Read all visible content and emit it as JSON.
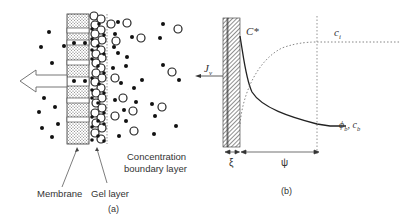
{
  "panel_a": {
    "caption": "(a)",
    "labels": {
      "membrane": "Membrane",
      "gel_layer": "Gel layer",
      "boundary_line1": "Concentration",
      "boundary_line2": "boundary layer"
    }
  },
  "panel_b": {
    "caption": "(b)",
    "labels": {
      "c_star": "C*",
      "c_i": "c",
      "c_i_sub": "i",
      "flux": "J",
      "flux_sub": "v",
      "bulk": "ϕ",
      "bulk_sub": "b",
      "bulk_sep": ", c",
      "bulk_sub2": "b",
      "xi": "ξ",
      "psi": "ψ"
    }
  },
  "colors": {
    "ink": "#222222",
    "hatch": "#555555",
    "dotted": "#666666"
  }
}
